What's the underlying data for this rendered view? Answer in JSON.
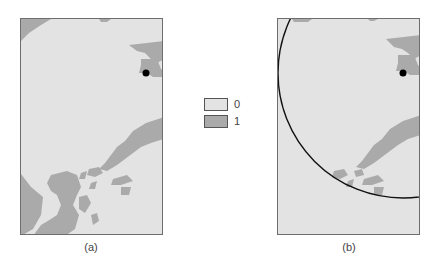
{
  "figure": {
    "panels": [
      {
        "id": "a",
        "caption": "(a)",
        "has_circle": false
      },
      {
        "id": "b",
        "caption": "(b)",
        "has_circle": true
      }
    ],
    "legend": {
      "items": [
        {
          "label": "0",
          "color": "#e3e3e3"
        },
        {
          "label": "1",
          "color": "#aaaaaa"
        }
      ]
    },
    "colors": {
      "class_0": "#e3e3e3",
      "class_1": "#aaaaaa",
      "border": "#6e6e6e",
      "marker": "#000000",
      "circle": "#111111"
    },
    "marker": {
      "x_in_panel": 125,
      "y_in_panel": 54,
      "radius": 3.5
    },
    "circle": {
      "cx_in_panel": 125,
      "cy_in_panel": 54,
      "r": 125
    }
  }
}
